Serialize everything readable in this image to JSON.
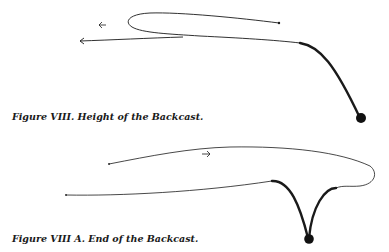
{
  "figures": [
    {
      "id": "figure-viii",
      "caption": "Figure VIII. Height of the Backcast.",
      "elements": [
        "thin line loop with direction arrow",
        "thick line descending to weight",
        "direction arrows pointing left"
      ]
    },
    {
      "id": "figure-viii-a",
      "caption": "Figure VIII A. End of the Backcast.",
      "elements": [
        "thin line loop with direction arrow",
        "thick V-shaped line with weight at bottom",
        "direction arrow pointing right"
      ]
    }
  ],
  "colors": {
    "line": "#1a1a1a",
    "background": "#ffffff"
  }
}
